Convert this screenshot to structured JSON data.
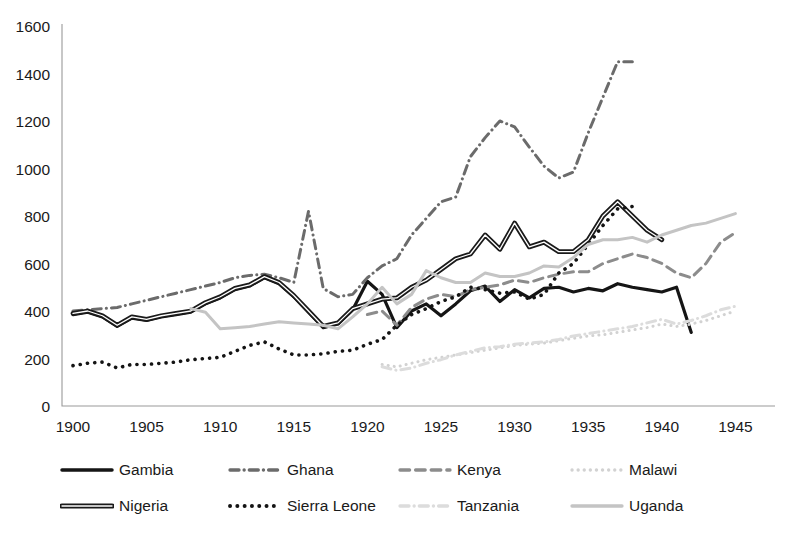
{
  "chart_data": {
    "type": "line",
    "title": "",
    "xlabel": "",
    "ylabel": "",
    "xlim": [
      1900,
      1947
    ],
    "ylim": [
      0,
      1600
    ],
    "grid": false,
    "legend_position": "bottom",
    "x_ticks": [
      "1900",
      "1905",
      "1910",
      "1915",
      "1920",
      "1925",
      "1930",
      "1935",
      "1940",
      "1945"
    ],
    "y_ticks": [
      "0",
      "200",
      "400",
      "600",
      "800",
      "1000",
      "1200",
      "1400",
      "1600"
    ],
    "series": [
      {
        "name": "Gambia",
        "color": "#151515",
        "style": "solid",
        "width": 3.2,
        "x": [
          1900,
          1901,
          1902,
          1903,
          1904,
          1905,
          1906,
          1907,
          1908,
          1909,
          1910,
          1911,
          1912,
          1913,
          1914,
          1915,
          1916,
          1917,
          1918,
          1919,
          1920,
          1921,
          1922,
          1923,
          1924,
          1925,
          1926,
          1927,
          1928,
          1929,
          1930,
          1931,
          1932,
          1933,
          1934,
          1935,
          1936,
          1937,
          1938,
          1939,
          1940,
          1941,
          1942
        ],
        "y": [
          385,
          395,
          375,
          335,
          370,
          360,
          375,
          385,
          395,
          430,
          455,
          490,
          505,
          540,
          515,
          460,
          395,
          330,
          345,
          405,
          525,
          470,
          330,
          400,
          430,
          380,
          430,
          485,
          505,
          440,
          490,
          455,
          495,
          500,
          480,
          495,
          485,
          515,
          500,
          490,
          480,
          500,
          310
        ]
      },
      {
        "name": "Ghana",
        "color": "#6b6b6b",
        "style": "dashdot",
        "width": 3.0,
        "x": [
          1900,
          1901,
          1902,
          1903,
          1904,
          1905,
          1906,
          1907,
          1908,
          1909,
          1910,
          1911,
          1912,
          1913,
          1914,
          1915,
          1916,
          1917,
          1918,
          1919,
          1920,
          1921,
          1922,
          1923,
          1924,
          1925,
          1926,
          1927,
          1928,
          1929,
          1930,
          1931,
          1932,
          1933,
          1934,
          1935,
          1936,
          1937,
          1938
        ],
        "y": [
          400,
          405,
          410,
          415,
          430,
          445,
          460,
          475,
          490,
          505,
          520,
          540,
          550,
          555,
          540,
          520,
          820,
          495,
          460,
          470,
          540,
          590,
          620,
          720,
          790,
          860,
          880,
          1050,
          1130,
          1200,
          1175,
          1090,
          1010,
          960,
          985,
          1150,
          1300,
          1450,
          1450
        ]
      },
      {
        "name": "Kenya",
        "color": "#8c8c8c",
        "style": "dashed",
        "width": 3.0,
        "x": [
          1920,
          1921,
          1922,
          1923,
          1924,
          1925,
          1926,
          1927,
          1928,
          1929,
          1930,
          1931,
          1932,
          1933,
          1934,
          1935,
          1936,
          1937,
          1938,
          1939,
          1940,
          1941,
          1942,
          1943,
          1944,
          1945
        ],
        "y": [
          385,
          400,
          340,
          415,
          450,
          470,
          460,
          490,
          500,
          510,
          530,
          520,
          540,
          555,
          565,
          565,
          600,
          620,
          640,
          625,
          600,
          560,
          540,
          600,
          690,
          730
        ]
      },
      {
        "name": "Malawi",
        "color": "#d2d2d2",
        "style": "dotted",
        "width": 3.0,
        "x": [
          1921,
          1922,
          1923,
          1924,
          1925,
          1926,
          1927,
          1928,
          1929,
          1930,
          1931,
          1932,
          1933,
          1934,
          1935,
          1936,
          1937,
          1938,
          1939,
          1940,
          1941,
          1942,
          1943,
          1944,
          1945
        ],
        "y": [
          175,
          165,
          180,
          195,
          205,
          215,
          225,
          235,
          245,
          255,
          260,
          265,
          275,
          285,
          295,
          300,
          310,
          320,
          330,
          345,
          335,
          345,
          360,
          380,
          400
        ]
      },
      {
        "name": "Nigeria",
        "color": "#1a1a1a",
        "style": "double",
        "width": 3.4,
        "x": [
          1900,
          1901,
          1902,
          1903,
          1904,
          1905,
          1906,
          1907,
          1908,
          1909,
          1910,
          1911,
          1912,
          1913,
          1914,
          1915,
          1916,
          1917,
          1918,
          1919,
          1920,
          1921,
          1922,
          1923,
          1924,
          1925,
          1926,
          1927,
          1928,
          1929,
          1930,
          1931,
          1932,
          1933,
          1934,
          1935,
          1936,
          1937,
          1938,
          1939,
          1940
        ],
        "y": [
          390,
          400,
          380,
          340,
          375,
          365,
          380,
          390,
          400,
          435,
          460,
          495,
          510,
          545,
          520,
          465,
          400,
          335,
          350,
          410,
          430,
          450,
          455,
          500,
          530,
          575,
          620,
          640,
          720,
          660,
          770,
          670,
          690,
          650,
          650,
          700,
          800,
          860,
          800,
          740,
          700
        ]
      },
      {
        "name": "Sierra Leone",
        "color": "#141414",
        "style": "dotted",
        "width": 3.6,
        "x": [
          1900,
          1901,
          1902,
          1903,
          1904,
          1905,
          1906,
          1907,
          1908,
          1909,
          1910,
          1911,
          1912,
          1913,
          1914,
          1915,
          1916,
          1917,
          1918,
          1919,
          1920,
          1921,
          1922,
          1923,
          1924,
          1925,
          1926,
          1927,
          1928,
          1929,
          1930,
          1931,
          1932,
          1933,
          1934,
          1935,
          1936,
          1937,
          1938
        ],
        "y": [
          170,
          180,
          185,
          160,
          175,
          175,
          180,
          185,
          195,
          200,
          205,
          230,
          255,
          270,
          240,
          215,
          215,
          220,
          230,
          235,
          260,
          280,
          340,
          385,
          410,
          440,
          460,
          500,
          490,
          475,
          480,
          450,
          470,
          560,
          600,
          680,
          760,
          830,
          840
        ]
      },
      {
        "name": "Tanzania",
        "color": "#dcdcdc",
        "style": "dashdot",
        "width": 3.0,
        "x": [
          1921,
          1922,
          1923,
          1924,
          1925,
          1926,
          1927,
          1928,
          1929,
          1930,
          1931,
          1932,
          1933,
          1934,
          1935,
          1936,
          1937,
          1938,
          1939,
          1940,
          1941,
          1942,
          1943,
          1944,
          1945
        ],
        "y": [
          165,
          150,
          160,
          180,
          195,
          215,
          230,
          245,
          250,
          260,
          265,
          270,
          280,
          295,
          305,
          315,
          325,
          335,
          350,
          365,
          345,
          360,
          380,
          405,
          420
        ]
      },
      {
        "name": "Uganda",
        "color": "#c4c4c4",
        "style": "solid",
        "width": 3.0,
        "x": [
          1908,
          1909,
          1910,
          1911,
          1912,
          1913,
          1914,
          1915,
          1916,
          1917,
          1918,
          1919,
          1920,
          1921,
          1922,
          1923,
          1924,
          1925,
          1926,
          1927,
          1928,
          1929,
          1930,
          1931,
          1932,
          1933,
          1934,
          1935,
          1936,
          1937,
          1938,
          1939,
          1940,
          1941,
          1942,
          1943,
          1944,
          1945
        ],
        "y": [
          410,
          395,
          325,
          330,
          335,
          345,
          355,
          350,
          345,
          340,
          325,
          375,
          430,
          500,
          430,
          470,
          570,
          540,
          520,
          520,
          560,
          545,
          545,
          560,
          590,
          585,
          625,
          680,
          700,
          700,
          710,
          690,
          720,
          740,
          760,
          770,
          790,
          810
        ]
      }
    ]
  },
  "legend": {
    "items": [
      {
        "label": "Gambia",
        "icon": "line-solid-swatch"
      },
      {
        "label": "Ghana",
        "icon": "line-dashdot-swatch"
      },
      {
        "label": "Kenya",
        "icon": "line-dashed-swatch"
      },
      {
        "label": "Malawi",
        "icon": "line-dotted-swatch"
      },
      {
        "label": "Nigeria",
        "icon": "line-double-swatch"
      },
      {
        "label": "Sierra Leone",
        "icon": "line-dotted-swatch"
      },
      {
        "label": "Tanzania",
        "icon": "line-dashdot-light-swatch"
      },
      {
        "label": "Uganda",
        "icon": "line-solid-light-swatch"
      }
    ]
  },
  "colors": {
    "gambia": "#151515",
    "ghana": "#6b6b6b",
    "kenya": "#8c8c8c",
    "malawi": "#d2d2d2",
    "nigeria": "#1a1a1a",
    "sierra_leone": "#141414",
    "tanzania": "#dcdcdc",
    "uganda": "#c4c4c4",
    "axis": "#9a9a9a",
    "text": "#1a1a1a"
  }
}
